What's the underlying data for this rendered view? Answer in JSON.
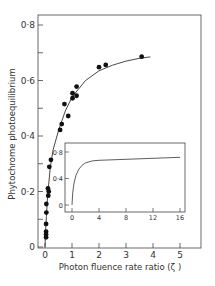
{
  "chart_data": [
    {
      "type": "scatter",
      "panel": "main",
      "title": "",
      "xlabel": "Photon fluence rate ratio (ζ)",
      "ylabel": "Phytochrome photoequilibrium",
      "xlim": [
        0,
        5.7
      ],
      "ylim": [
        0,
        0.84
      ],
      "x_ticks": [
        0,
        1,
        2,
        3,
        4,
        5
      ],
      "x_tick_labels": [
        "0",
        "1",
        "2",
        "3",
        "4",
        "5"
      ],
      "y_ticks": [
        0,
        0.1,
        0.2,
        0.3,
        0.4,
        0.5,
        0.6,
        0.7,
        0.8
      ],
      "y_tick_labels": [
        "0",
        "",
        "0·2",
        "",
        "0·4",
        "",
        "0·6",
        "",
        "0·8"
      ],
      "grid": false,
      "legend": null,
      "series": [
        {
          "name": "measured",
          "marker": "filled-circle",
          "points": [
            [
              0.04,
              0.035
            ],
            [
              0.04,
              0.045
            ],
            [
              0.04,
              0.055
            ],
            [
              0.04,
              0.083
            ],
            [
              0.05,
              0.124
            ],
            [
              0.05,
              0.155
            ],
            [
              0.12,
              0.185
            ],
            [
              0.14,
              0.2
            ],
            [
              0.11,
              0.211
            ],
            [
              0.16,
              0.289
            ],
            [
              0.22,
              0.314
            ],
            [
              0.56,
              0.422
            ],
            [
              0.62,
              0.443
            ],
            [
              0.86,
              0.472
            ],
            [
              0.72,
              0.515
            ],
            [
              1.02,
              0.536
            ],
            [
              1.17,
              0.545
            ],
            [
              1.02,
              0.554
            ],
            [
              1.17,
              0.578
            ],
            [
              2.0,
              0.648
            ],
            [
              2.25,
              0.656
            ],
            [
              3.58,
              0.686
            ]
          ]
        },
        {
          "name": "fitted curve",
          "style": "line",
          "points": [
            [
              0.0,
              0.0
            ],
            [
              0.02,
              0.05
            ],
            [
              0.05,
              0.11
            ],
            [
              0.1,
              0.19
            ],
            [
              0.2,
              0.29
            ],
            [
              0.3,
              0.35
            ],
            [
              0.5,
              0.42
            ],
            [
              0.75,
              0.49
            ],
            [
              1.0,
              0.54
            ],
            [
              1.5,
              0.6
            ],
            [
              2.0,
              0.635
            ],
            [
              2.5,
              0.655
            ],
            [
              3.0,
              0.67
            ],
            [
              3.5,
              0.68
            ],
            [
              3.9,
              0.685
            ]
          ]
        }
      ]
    },
    {
      "type": "line",
      "panel": "inset",
      "title": "",
      "xlabel": "",
      "ylabel": "",
      "xlim": [
        -0.5,
        17
      ],
      "ylim": [
        -0.05,
        0.9
      ],
      "x_ticks": [
        0,
        4,
        8,
        12,
        16
      ],
      "x_tick_labels": [
        "0",
        "4",
        "8",
        "12",
        "16"
      ],
      "y_ticks": [
        0,
        0.4,
        0.8
      ],
      "y_tick_labels": [
        "0",
        "0·4",
        "0·8"
      ],
      "grid": false,
      "series": [
        {
          "name": "model curve",
          "points": [
            [
              0.0,
              0.0
            ],
            [
              0.1,
              0.18
            ],
            [
              0.3,
              0.33
            ],
            [
              0.6,
              0.45
            ],
            [
              1.0,
              0.54
            ],
            [
              1.5,
              0.6
            ],
            [
              2.0,
              0.635
            ],
            [
              3.0,
              0.665
            ],
            [
              4.0,
              0.675
            ],
            [
              8.0,
              0.69
            ],
            [
              12.0,
              0.705
            ],
            [
              16.0,
              0.72
            ]
          ]
        }
      ]
    }
  ],
  "labels": {
    "ylabel": "Phytochrome photoequilibrium",
    "xlabel": "Photon fluence rate ratio (ζ )"
  }
}
